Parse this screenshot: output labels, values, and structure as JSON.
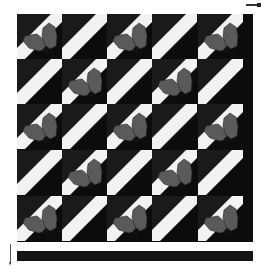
{
  "image": {
    "subject": "quilt block pattern",
    "rows": 5,
    "columns": 5,
    "tile_types": {
      "holly": "diagonal stripe with two holly leaves and berry",
      "plain": "diagonal stripe only"
    },
    "layout": [
      [
        "holly",
        "plain",
        "holly",
        "plain",
        "holly"
      ],
      [
        "plain",
        "holly",
        "plain",
        "holly",
        "plain"
      ],
      [
        "holly",
        "plain",
        "holly",
        "plain",
        "holly"
      ],
      [
        "plain",
        "holly",
        "plain",
        "holly",
        "plain"
      ],
      [
        "holly",
        "plain",
        "holly",
        "plain",
        "holly"
      ]
    ],
    "colors": {
      "background": "#ffffff",
      "tile_dark": "#1a1a1a",
      "tile_darker": "#0c0c0c",
      "stripe": "#f2f2f2",
      "leaf": "#5a5a5a",
      "leaf_outline": "#2a2a2a",
      "berry": "#111111",
      "frame": "#0c0c0c"
    }
  }
}
